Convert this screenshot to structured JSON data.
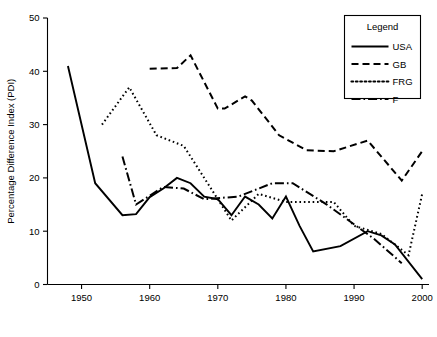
{
  "chart_data": {
    "type": "line",
    "title": "",
    "xlabel": "",
    "ylabel": "Percentage Difference Index (PDI)",
    "xlim": [
      1945,
      2001
    ],
    "ylim": [
      0,
      50
    ],
    "xticks": [
      1950,
      1960,
      1970,
      1980,
      1990,
      2000
    ],
    "xtick_labels": [
      "1950",
      "1960",
      "1970",
      "1980",
      "1990",
      "2000"
    ],
    "yticks": [
      0,
      10,
      20,
      30,
      40,
      50
    ],
    "ytick_labels": [
      "0",
      "10",
      "20",
      "30",
      "40",
      "50"
    ],
    "grid": false,
    "legend": {
      "title": "Legend",
      "position": "top-right",
      "entries": [
        {
          "label": "USA",
          "dash": "solid"
        },
        {
          "label": "GB",
          "dash": "dashed"
        },
        {
          "label": "FRG",
          "dash": "dotted"
        },
        {
          "label": "F",
          "dash": "dashdot"
        }
      ]
    },
    "series": [
      {
        "name": "USA",
        "dash": "solid",
        "stroke_width": 1.9,
        "dasharray": "",
        "x": [
          1948,
          1952,
          1956,
          1958,
          1960,
          1962,
          1964,
          1966,
          1968,
          1970,
          1972,
          1974,
          1976,
          1978,
          1980,
          1982,
          1984,
          1988,
          1992,
          1994,
          1996,
          2000
        ],
        "y": [
          41.0,
          19.0,
          13.0,
          13.2,
          16.4,
          18.0,
          20.0,
          19.0,
          16.5,
          16.0,
          13.0,
          16.5,
          15.0,
          12.4,
          16.5,
          11.0,
          6.2,
          7.2,
          10.0,
          9.2,
          7.5,
          1.0
        ]
      },
      {
        "name": "GB",
        "dash": "dashed",
        "stroke_width": 2.0,
        "dasharray": "7,4",
        "x": [
          1960,
          1964,
          1966,
          1970,
          1971,
          1974,
          1975,
          1979,
          1983,
          1987,
          1992,
          1997,
          2000
        ],
        "y": [
          40.5,
          40.6,
          43.0,
          33.0,
          33.0,
          35.3,
          34.5,
          28.0,
          25.2,
          25.0,
          27.0,
          19.5,
          25.0
        ]
      },
      {
        "name": "FRG",
        "dash": "dotted",
        "stroke_width": 2.0,
        "dasharray": "1.6,2.8",
        "x": [
          1953,
          1957,
          1961,
          1965,
          1969,
          1972,
          1976,
          1980,
          1983,
          1987,
          1990,
          1994,
          1998,
          2000
        ],
        "y": [
          30.0,
          37.0,
          28.0,
          26.0,
          18.0,
          12.0,
          17.0,
          15.5,
          15.5,
          15.5,
          11.0,
          9.5,
          5.5,
          17.0
        ]
      },
      {
        "name": "F",
        "dash": "dashdot",
        "stroke_width": 2.0,
        "dasharray": "9,3,1.6,3",
        "x": [
          1956,
          1958,
          1962,
          1965,
          1968,
          1973,
          1978,
          1981,
          1986,
          1993,
          1997
        ],
        "y": [
          24.0,
          15.0,
          18.3,
          18.0,
          16.0,
          16.5,
          19.0,
          19.0,
          15.0,
          8.5,
          4.0
        ]
      }
    ]
  }
}
